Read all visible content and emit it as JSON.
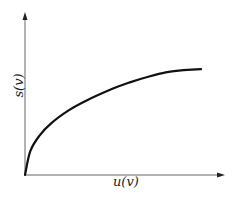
{
  "chart_data": {
    "type": "line",
    "title": "",
    "xlabel": "u(v)",
    "ylabel": "s(v)",
    "grid": false,
    "legend": null,
    "ticks": {
      "x": [],
      "y": []
    },
    "series": [
      {
        "name": "s(v) vs u(v)",
        "color": "#111111",
        "x": [
          0,
          0.03,
          0.08,
          0.15,
          0.25,
          0.35,
          0.5,
          0.6,
          0.7,
          0.8,
          0.9,
          1.0
        ],
        "y": [
          0,
          0.22,
          0.36,
          0.48,
          0.6,
          0.69,
          0.8,
          0.86,
          0.91,
          0.95,
          0.97,
          0.98
        ]
      }
    ],
    "xlim": [
      0,
      1.12
    ],
    "ylim": [
      0,
      1.5
    ]
  },
  "plot_box": {
    "origin_px": [
      25,
      175
    ],
    "x_axis_end_px": 224,
    "y_axis_end_px": 13,
    "x_data_px_per_unit": 176,
    "y_data_px_per_unit": 108
  },
  "colors": {
    "axis": "#666666",
    "curve": "#111111",
    "background": "#ffffff"
  }
}
